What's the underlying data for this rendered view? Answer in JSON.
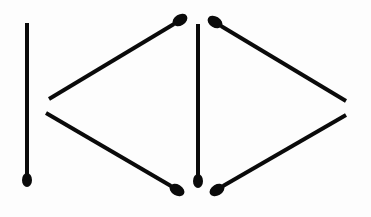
{
  "diagram": {
    "colors": {
      "background": "#fdfdfd",
      "matchstick": "#0a0a0a"
    },
    "matchsticks": [
      {
        "id": "left-vertical",
        "x1": 27,
        "y1": 23,
        "x2": 27,
        "y2": 174,
        "head": {
          "cx": 27,
          "cy": 180,
          "rx": 5,
          "ry": 7,
          "rotate": 0
        }
      },
      {
        "id": "left-upper-diagonal",
        "x1": 49,
        "y1": 99,
        "x2": 174,
        "y2": 24,
        "head": {
          "cx": 180,
          "cy": 20,
          "rx": 8,
          "ry": 5.5,
          "rotate": -31
        }
      },
      {
        "id": "left-lower-diagonal",
        "x1": 46,
        "y1": 113,
        "x2": 171,
        "y2": 186,
        "head": {
          "cx": 177,
          "cy": 190,
          "rx": 8,
          "ry": 5.5,
          "rotate": 30
        }
      },
      {
        "id": "middle-vertical",
        "x1": 198,
        "y1": 24,
        "x2": 198,
        "y2": 175,
        "head": {
          "cx": 198,
          "cy": 181,
          "rx": 5,
          "ry": 7,
          "rotate": 0
        }
      },
      {
        "id": "right-upper-diagonal",
        "x1": 221,
        "y1": 26,
        "x2": 346,
        "y2": 101,
        "head": {
          "cx": 215,
          "cy": 22,
          "rx": 8,
          "ry": 5.5,
          "rotate": 31
        }
      },
      {
        "id": "right-lower-diagonal",
        "x1": 223,
        "y1": 186,
        "x2": 346,
        "y2": 115,
        "head": {
          "cx": 217,
          "cy": 190,
          "rx": 8,
          "ry": 5.5,
          "rotate": -30
        }
      }
    ]
  }
}
